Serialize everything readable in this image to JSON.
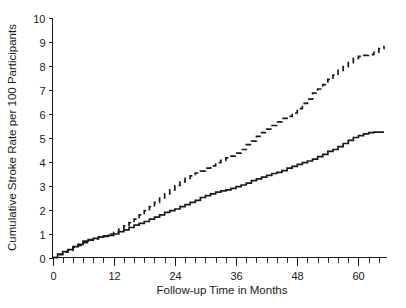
{
  "chart_data": {
    "type": "line",
    "title": "",
    "xlabel": "Follow-up Time in Months",
    "ylabel": "Cumulative Stroke Rate per 100 Participants",
    "xlim": [
      0,
      65.5
    ],
    "ylim": [
      0,
      10
    ],
    "xticks_major": [
      0,
      12,
      24,
      36,
      48,
      60
    ],
    "xtick_labels": [
      "0",
      "12",
      "24",
      "36",
      "48",
      "60"
    ],
    "xtick_minor_step": 2,
    "yticks": [
      0,
      1,
      2,
      3,
      4,
      5,
      6,
      7,
      8,
      9,
      10
    ],
    "ytick_labels": [
      "0",
      "1",
      "2",
      "3",
      "4",
      "5",
      "6",
      "7",
      "8",
      "9",
      "10"
    ],
    "grid": false,
    "legend": "none",
    "series": [
      {
        "name": "Dashed curve (higher cumulative stroke rate)",
        "style": "dashed",
        "color": "#1a1a1a",
        "x": [
          0,
          1,
          2,
          3,
          4,
          5,
          6,
          7,
          8,
          9,
          10,
          11,
          12,
          13,
          14,
          15,
          16,
          17,
          18,
          19,
          20,
          21,
          22,
          23,
          24,
          25,
          26,
          27,
          28,
          29,
          30,
          31,
          32,
          33,
          34,
          35,
          36,
          37,
          38,
          39,
          40,
          41,
          42,
          43,
          44,
          45,
          46,
          47,
          48,
          49,
          50,
          51,
          52,
          53,
          54,
          55,
          56,
          57,
          58,
          59,
          60,
          61,
          62,
          63,
          64,
          65
        ],
        "y": [
          0.0,
          0.12,
          0.22,
          0.3,
          0.42,
          0.5,
          0.62,
          0.72,
          0.78,
          0.85,
          0.9,
          0.98,
          1.05,
          1.18,
          1.32,
          1.45,
          1.6,
          1.78,
          1.95,
          2.12,
          2.3,
          2.48,
          2.65,
          2.82,
          3.0,
          3.15,
          3.3,
          3.4,
          3.52,
          3.6,
          3.72,
          3.82,
          3.95,
          4.05,
          4.15,
          4.22,
          4.35,
          4.5,
          4.7,
          4.85,
          5.05,
          5.2,
          5.35,
          5.5,
          5.65,
          5.8,
          5.88,
          6.02,
          6.2,
          6.42,
          6.6,
          6.85,
          7.02,
          7.2,
          7.42,
          7.6,
          7.8,
          7.95,
          8.12,
          8.3,
          8.38,
          8.42,
          8.45,
          8.55,
          8.7,
          8.82
        ]
      },
      {
        "name": "Solid curve (lower cumulative stroke rate)",
        "style": "solid",
        "color": "#1a1a1a",
        "x": [
          0,
          1,
          2,
          3,
          4,
          5,
          6,
          7,
          8,
          9,
          10,
          11,
          12,
          13,
          14,
          15,
          16,
          17,
          18,
          19,
          20,
          21,
          22,
          23,
          24,
          25,
          26,
          27,
          28,
          29,
          30,
          31,
          32,
          33,
          34,
          35,
          36,
          37,
          38,
          39,
          40,
          41,
          42,
          43,
          44,
          45,
          46,
          47,
          48,
          49,
          50,
          51,
          52,
          53,
          54,
          55,
          56,
          57,
          58,
          59,
          60,
          61,
          62,
          63,
          64,
          65
        ],
        "y": [
          0.0,
          0.14,
          0.25,
          0.33,
          0.45,
          0.55,
          0.68,
          0.75,
          0.8,
          0.85,
          0.88,
          0.92,
          0.98,
          1.08,
          1.15,
          1.25,
          1.35,
          1.42,
          1.5,
          1.6,
          1.68,
          1.78,
          1.88,
          1.95,
          2.02,
          2.12,
          2.2,
          2.3,
          2.38,
          2.5,
          2.58,
          2.65,
          2.72,
          2.78,
          2.82,
          2.88,
          2.95,
          3.02,
          3.1,
          3.2,
          3.28,
          3.35,
          3.42,
          3.5,
          3.55,
          3.62,
          3.72,
          3.8,
          3.88,
          3.95,
          4.02,
          4.1,
          4.2,
          4.3,
          4.42,
          4.5,
          4.62,
          4.75,
          4.88,
          5.0,
          5.08,
          5.15,
          5.2,
          5.22,
          5.22,
          5.22
        ]
      }
    ]
  },
  "axes": {
    "y_axis_label": "Cumulative Stroke Rate per 100 Participants",
    "x_axis_label": "Follow-up Time in Months"
  }
}
